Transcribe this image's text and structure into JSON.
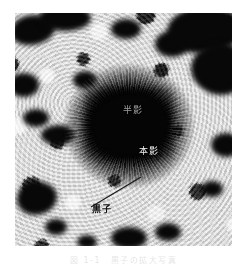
{
  "figure": {
    "kind": "sunspot-photograph",
    "caption": "図 1-1　黒子の拡大写真",
    "plate": {
      "background_color": "#d8d8d8",
      "dark_color": "#080808",
      "light_color": "#f6f6f6"
    }
  },
  "annotations": [
    {
      "id": "penumbra",
      "label": "半影",
      "color": "#d9d9d9",
      "has_leader": false
    },
    {
      "id": "umbra",
      "label": "本影",
      "color": "#f2f2f2",
      "has_leader": false
    },
    {
      "id": "sunspot",
      "label": "黒子",
      "color": "#111111",
      "has_leader": true
    }
  ],
  "leader_line": {
    "color": "#1a1a1a",
    "from_x": 6,
    "from_y": 34,
    "to_x": 56,
    "to_y": 4
  }
}
